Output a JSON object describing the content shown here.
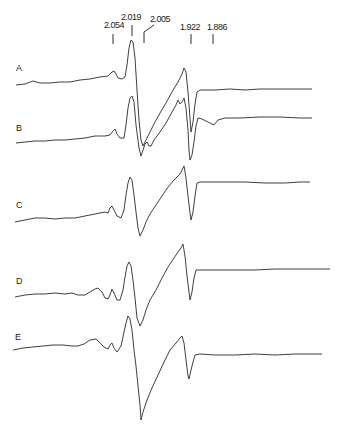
{
  "chart_data": {
    "type": "line",
    "title": "",
    "xlabel": "",
    "ylabel": "",
    "grid": false,
    "legend": "none",
    "g_value_markers": [
      {
        "label": "2.054",
        "x": 113,
        "label_x": 104,
        "label_y": 28,
        "tick_top": 34,
        "tick_bottom": 44
      },
      {
        "label": "2.019",
        "x": 132,
        "label_x": 121,
        "label_y": 20,
        "tick_top": 25,
        "tick_bottom": 36
      },
      {
        "label": "2.005",
        "x": 144,
        "label_x": 150,
        "label_y": 22,
        "tick_top": 32,
        "tick_bottom": 43,
        "leader": true
      },
      {
        "label": "1.922",
        "x": 191,
        "label_x": 180,
        "label_y": 30,
        "tick_top": 34,
        "tick_bottom": 44
      },
      {
        "label": "1.886",
        "x": 213,
        "label_x": 207,
        "label_y": 30,
        "tick_top": 34,
        "tick_bottom": 44
      }
    ],
    "series": [
      {
        "name": "A",
        "label_x": 16,
        "label_y": 71,
        "points": [
          [
            16,
            85
          ],
          [
            25,
            84
          ],
          [
            33,
            81
          ],
          [
            40,
            83
          ],
          [
            50,
            83
          ],
          [
            60,
            82
          ],
          [
            70,
            82
          ],
          [
            80,
            80
          ],
          [
            90,
            79
          ],
          [
            100,
            77
          ],
          [
            108,
            76
          ],
          [
            112,
            72
          ],
          [
            114,
            71
          ],
          [
            116,
            74
          ],
          [
            118,
            78
          ],
          [
            122,
            79
          ],
          [
            125,
            77
          ],
          [
            127,
            65
          ],
          [
            129,
            48
          ],
          [
            131,
            40
          ],
          [
            133,
            42
          ],
          [
            135,
            58
          ],
          [
            137,
            90
          ],
          [
            139,
            120
          ],
          [
            141,
            140
          ],
          [
            143,
            146
          ],
          [
            146,
            140
          ],
          [
            150,
            132
          ],
          [
            155,
            122
          ],
          [
            160,
            113
          ],
          [
            166,
            103
          ],
          [
            172,
            92
          ],
          [
            178,
            82
          ],
          [
            182,
            74
          ],
          [
            184,
            68
          ],
          [
            186,
            72
          ],
          [
            188,
            92
          ],
          [
            190,
            118
          ],
          [
            191,
            132
          ],
          [
            193,
            122
          ],
          [
            195,
            104
          ],
          [
            197,
            92
          ],
          [
            200,
            90
          ],
          [
            215,
            90
          ],
          [
            230,
            89
          ],
          [
            245,
            90
          ],
          [
            260,
            89
          ],
          [
            275,
            89
          ],
          [
            290,
            89
          ],
          [
            305,
            89
          ],
          [
            312,
            89
          ]
        ]
      },
      {
        "name": "B",
        "label_x": 16,
        "label_y": 131,
        "points": [
          [
            16,
            143
          ],
          [
            25,
            142
          ],
          [
            35,
            141
          ],
          [
            45,
            141
          ],
          [
            55,
            140
          ],
          [
            65,
            140
          ],
          [
            75,
            139
          ],
          [
            85,
            138
          ],
          [
            95,
            136
          ],
          [
            105,
            136
          ],
          [
            110,
            135
          ],
          [
            113,
            131
          ],
          [
            115,
            129
          ],
          [
            117,
            134
          ],
          [
            120,
            138
          ],
          [
            124,
            138
          ],
          [
            126,
            125
          ],
          [
            128,
            108
          ],
          [
            130,
            98
          ],
          [
            132,
            96
          ],
          [
            134,
            102
          ],
          [
            136,
            125
          ],
          [
            139,
            148
          ],
          [
            141,
            156
          ],
          [
            143,
            150
          ],
          [
            145,
            144
          ],
          [
            147,
            142
          ],
          [
            149,
            146
          ],
          [
            151,
            146
          ],
          [
            154,
            140
          ],
          [
            160,
            132
          ],
          [
            166,
            123
          ],
          [
            172,
            112
          ],
          [
            176,
            105
          ],
          [
            178,
            100
          ],
          [
            180,
            104
          ],
          [
            182,
            102
          ],
          [
            184,
            98
          ],
          [
            186,
            108
          ],
          [
            188,
            130
          ],
          [
            189,
            150
          ],
          [
            190,
            160
          ],
          [
            192,
            155
          ],
          [
            194,
            142
          ],
          [
            196,
            126
          ],
          [
            198,
            118
          ],
          [
            202,
            119
          ],
          [
            210,
            123
          ],
          [
            214,
            125
          ],
          [
            218,
            120
          ],
          [
            225,
            118
          ],
          [
            240,
            118
          ],
          [
            260,
            117
          ],
          [
            280,
            117
          ],
          [
            300,
            118
          ],
          [
            312,
            118
          ]
        ]
      },
      {
        "name": "C",
        "label_x": 16,
        "label_y": 208,
        "points": [
          [
            15,
            222
          ],
          [
            25,
            220
          ],
          [
            35,
            218
          ],
          [
            45,
            218
          ],
          [
            55,
            219
          ],
          [
            65,
            218
          ],
          [
            75,
            218
          ],
          [
            85,
            216
          ],
          [
            95,
            214
          ],
          [
            105,
            212
          ],
          [
            108,
            213
          ],
          [
            110,
            208
          ],
          [
            112,
            206
          ],
          [
            114,
            210
          ],
          [
            117,
            216
          ],
          [
            121,
            218
          ],
          [
            124,
            210
          ],
          [
            126,
            195
          ],
          [
            128,
            183
          ],
          [
            130,
            177
          ],
          [
            132,
            180
          ],
          [
            134,
            195
          ],
          [
            136,
            212
          ],
          [
            138,
            228
          ],
          [
            140,
            236
          ],
          [
            143,
            230
          ],
          [
            146,
            222
          ],
          [
            150,
            214
          ],
          [
            156,
            205
          ],
          [
            162,
            196
          ],
          [
            168,
            187
          ],
          [
            174,
            180
          ],
          [
            180,
            174
          ],
          [
            182,
            170
          ],
          [
            184,
            166
          ],
          [
            186,
            178
          ],
          [
            188,
            196
          ],
          [
            190,
            213
          ],
          [
            191,
            220
          ],
          [
            193,
            212
          ],
          [
            195,
            196
          ],
          [
            197,
            183
          ],
          [
            200,
            182
          ],
          [
            210,
            182
          ],
          [
            225,
            182
          ],
          [
            245,
            182
          ],
          [
            265,
            183
          ],
          [
            285,
            183
          ],
          [
            300,
            182
          ],
          [
            310,
            182
          ]
        ]
      },
      {
        "name": "D",
        "label_x": 16,
        "label_y": 284,
        "points": [
          [
            15,
            297
          ],
          [
            25,
            295
          ],
          [
            35,
            294
          ],
          [
            45,
            294
          ],
          [
            55,
            293
          ],
          [
            65,
            294
          ],
          [
            72,
            293
          ],
          [
            78,
            295
          ],
          [
            85,
            295
          ],
          [
            90,
            292
          ],
          [
            95,
            289
          ],
          [
            98,
            288
          ],
          [
            102,
            292
          ],
          [
            105,
            298
          ],
          [
            108,
            299
          ],
          [
            110,
            295
          ],
          [
            112,
            289
          ],
          [
            114,
            293
          ],
          [
            117,
            300
          ],
          [
            120,
            300
          ],
          [
            123,
            290
          ],
          [
            125,
            277
          ],
          [
            127,
            266
          ],
          [
            129,
            262
          ],
          [
            131,
            266
          ],
          [
            133,
            280
          ],
          [
            135,
            298
          ],
          [
            137,
            318
          ],
          [
            140,
            326
          ],
          [
            143,
            320
          ],
          [
            146,
            310
          ],
          [
            150,
            300
          ],
          [
            156,
            290
          ],
          [
            162,
            278
          ],
          [
            168,
            267
          ],
          [
            174,
            258
          ],
          [
            178,
            252
          ],
          [
            181,
            248
          ],
          [
            183,
            244
          ],
          [
            185,
            256
          ],
          [
            187,
            276
          ],
          [
            189,
            292
          ],
          [
            190,
            300
          ],
          [
            192,
            292
          ],
          [
            194,
            278
          ],
          [
            196,
            270
          ],
          [
            200,
            270
          ],
          [
            215,
            270
          ],
          [
            235,
            270
          ],
          [
            255,
            270
          ],
          [
            275,
            269
          ],
          [
            295,
            269
          ],
          [
            315,
            269
          ],
          [
            330,
            269
          ]
        ]
      },
      {
        "name": "E",
        "label_x": 15,
        "label_y": 340,
        "points": [
          [
            13,
            350
          ],
          [
            23,
            348
          ],
          [
            33,
            347
          ],
          [
            43,
            346
          ],
          [
            53,
            345
          ],
          [
            63,
            345
          ],
          [
            72,
            346
          ],
          [
            78,
            346
          ],
          [
            84,
            344
          ],
          [
            90,
            340
          ],
          [
            96,
            339
          ],
          [
            100,
            343
          ],
          [
            104,
            347
          ],
          [
            108,
            349
          ],
          [
            110,
            345
          ],
          [
            112,
            343
          ],
          [
            114,
            348
          ],
          [
            117,
            352
          ],
          [
            121,
            346
          ],
          [
            124,
            332
          ],
          [
            126,
            323
          ],
          [
            128,
            316
          ],
          [
            130,
            319
          ],
          [
            132,
            330
          ],
          [
            134,
            350
          ],
          [
            136,
            366
          ],
          [
            138,
            386
          ],
          [
            140,
            405
          ],
          [
            141,
            420
          ],
          [
            143,
            412
          ],
          [
            147,
            400
          ],
          [
            152,
            388
          ],
          [
            158,
            375
          ],
          [
            164,
            362
          ],
          [
            170,
            350
          ],
          [
            176,
            343
          ],
          [
            180,
            338
          ],
          [
            182,
            336
          ],
          [
            184,
            343
          ],
          [
            186,
            360
          ],
          [
            188,
            376
          ],
          [
            189,
            379
          ],
          [
            191,
            370
          ],
          [
            193,
            362
          ],
          [
            195,
            355
          ],
          [
            200,
            354
          ],
          [
            215,
            355
          ],
          [
            235,
            355
          ],
          [
            255,
            354
          ],
          [
            275,
            355
          ],
          [
            295,
            354
          ],
          [
            315,
            354
          ],
          [
            322,
            354
          ]
        ]
      }
    ]
  }
}
